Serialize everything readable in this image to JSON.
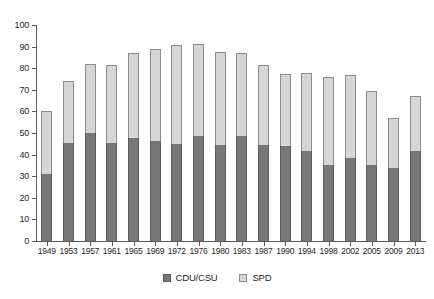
{
  "chart_data": {
    "type": "bar",
    "stacked": true,
    "title": "",
    "subtitle": "",
    "xlabel": "",
    "ylabel": "",
    "ylim": [
      0,
      100
    ],
    "yticks": [
      0,
      10,
      20,
      30,
      40,
      50,
      60,
      70,
      80,
      90,
      100
    ],
    "grid": false,
    "legend_position": "bottom-center",
    "categories": [
      "1949",
      "1953",
      "1957",
      "1961",
      "1965",
      "1969",
      "1972",
      "1976",
      "1980",
      "1983",
      "1987",
      "1990",
      "1994",
      "1998",
      "2002",
      "2005",
      "2009",
      "2013"
    ],
    "series": [
      {
        "name": "CDU/CSU",
        "color": "#77777a",
        "values": [
          31.0,
          45.2,
          50.2,
          45.3,
          47.6,
          46.1,
          44.9,
          48.6,
          44.5,
          48.8,
          44.3,
          43.8,
          41.5,
          35.1,
          38.5,
          35.2,
          33.8,
          41.5
        ]
      },
      {
        "name": "SPD",
        "color": "#d5d5d3",
        "values": [
          29.2,
          28.8,
          31.8,
          36.2,
          39.3,
          42.7,
          45.8,
          42.6,
          42.9,
          38.2,
          37.0,
          33.5,
          36.4,
          40.9,
          38.5,
          34.2,
          23.0,
          25.6
        ]
      }
    ],
    "totals": [
      60.2,
      74.0,
      82.0,
      81.5,
      86.9,
      88.8,
      90.7,
      91.2,
      87.4,
      87.0,
      81.3,
      77.3,
      77.9,
      76.0,
      77.0,
      69.4,
      56.8,
      67.1
    ]
  },
  "legend": {
    "items": [
      {
        "label": "CDU/CSU",
        "swatch": "cdu-swatch"
      },
      {
        "label": "SPD",
        "swatch": "spd-swatch"
      }
    ]
  },
  "axes": {
    "y_tick_labels": [
      "0",
      "10",
      "20",
      "30",
      "40",
      "50",
      "60",
      "70",
      "80",
      "90",
      "100"
    ],
    "x_tick_labels": [
      "1949",
      "1953",
      "1957",
      "1961",
      "1965",
      "1969",
      "1972",
      "1976",
      "1980",
      "1983",
      "1987",
      "1990",
      "1994",
      "1998",
      "2002",
      "2005",
      "2009",
      "2013"
    ]
  }
}
